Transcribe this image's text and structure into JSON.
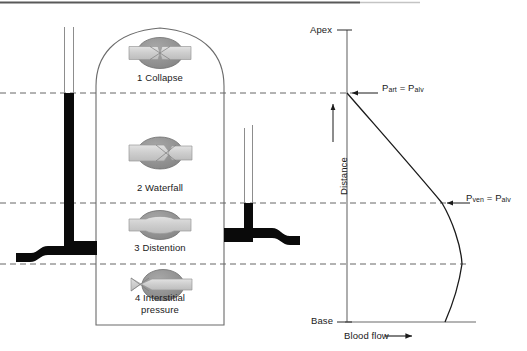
{
  "diagram": {
    "lung": {
      "name": "lung-outline",
      "zones": [
        {
          "id": 1,
          "label": "1 Collapse",
          "capillary_state": "collapsed",
          "label_x": 160,
          "label_y": 78,
          "vessel_cx": 160,
          "vessel_cy": 53
        },
        {
          "id": 2,
          "label": "2 Waterfall",
          "capillary_state": "pinched-downstream",
          "label_x": 160,
          "label_y": 188,
          "vessel_cx": 160,
          "vessel_cy": 153
        },
        {
          "id": 3,
          "label": "3 Distention",
          "capillary_state": "distended",
          "label_x": 160,
          "label_y": 248,
          "vessel_cx": 160,
          "vessel_cy": 225
        },
        {
          "id": 4,
          "label": "4 Interstitial",
          "label_line2": "pressure",
          "capillary_state": "narrowed-upstream",
          "label_x": 160,
          "label_y": 298,
          "vessel_cx": 160,
          "vessel_cy": 285
        }
      ]
    },
    "manometers": [
      {
        "name": "arterial-manometer",
        "fluid_top_y": 93,
        "tube_x": 68,
        "description": "arterial pressure column"
      },
      {
        "name": "venous-manometer",
        "fluid_top_y": 203,
        "tube_x": 248,
        "description": "venous pressure column"
      }
    ],
    "pressure_lines": [
      {
        "name": "p-art-equals-p-alv-line",
        "y": 93
      },
      {
        "name": "p-ven-equals-p-alv-line",
        "y": 203
      },
      {
        "name": "zone-3-4-boundary-line",
        "y": 264
      }
    ]
  },
  "chart": {
    "type": "line",
    "axis": {
      "y_top_label": "Apex",
      "y_bottom_label": "Base",
      "y_axis_title": "Distance",
      "x_axis_title": "Blood flow",
      "x_axis_arrow": "⟶",
      "y_arrow": "↑",
      "x_axis_y": 322,
      "y_axis_x": 347,
      "y_axis_top": 30,
      "x_axis_right": 476
    },
    "annotations": [
      {
        "name": "p-art-annotation",
        "text_main": "P",
        "text_sub": "art",
        "text_eq": " = P",
        "text_sub2": "alv",
        "full": "Part = Palv",
        "x": 382,
        "y": 87
      },
      {
        "name": "p-ven-annotation",
        "text_main": "P",
        "text_sub": "ven",
        "text_eq": " = P",
        "text_sub2": "alv",
        "full": "Pven = Palv",
        "x": 465,
        "y": 197
      }
    ],
    "curve_points": [
      {
        "x": 347,
        "y": 93
      },
      {
        "x": 442,
        "y": 203
      },
      {
        "x": 462,
        "y": 264
      },
      {
        "x": 445,
        "y": 322
      }
    ]
  },
  "colors": {
    "ink": "#1a1a1a",
    "line": "#555555",
    "vessel_wall": "#8c8c8c",
    "vessel_lumen": "#c9c9c9",
    "manometer_fluid": "#000000",
    "dashed": "#666666"
  }
}
